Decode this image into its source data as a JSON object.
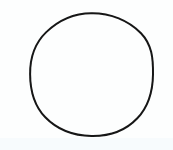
{
  "image": {
    "width": 173,
    "height": 150,
    "background_color": "#ffffff",
    "scan_tint_color": "#fdfefe",
    "scan_bottom_band_color": "#f7fbfd",
    "caption": ""
  },
  "figure": {
    "name": "circle",
    "shape": "circle",
    "stroke_color": "#151515",
    "stroke_width": 2,
    "fill_color": "none",
    "center_x": 91.5,
    "center_y": 74.5,
    "radius": 61.5,
    "bounds": {
      "left": 30,
      "top": 13,
      "right": 153,
      "bottom": 136
    },
    "label": ""
  }
}
